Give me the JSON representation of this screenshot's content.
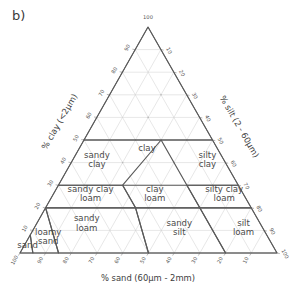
{
  "panel": {
    "label": "b)"
  },
  "axes": {
    "bottom": {
      "title": "% sand (60µm - 2mm)",
      "ticks": [
        100,
        90,
        80,
        70,
        60,
        50,
        40,
        30,
        20,
        10
      ]
    },
    "left": {
      "title": "% clay (<2µm)",
      "ticks": [
        10,
        20,
        30,
        40,
        50,
        60,
        70,
        80,
        90
      ]
    },
    "right": {
      "title": "% silt (2 - 60µm)",
      "ticks": [
        10,
        20,
        30,
        40,
        50,
        60,
        70,
        80,
        90,
        100
      ]
    },
    "apex": {
      "label": "100"
    }
  },
  "colors": {
    "grid": "#cfcfcf",
    "outline": "#6e6e6e",
    "class_boundary": "#5a5a5a",
    "text": "#4a4a4a",
    "background": "#ffffff"
  },
  "chart_data": {
    "type": "ternary-diagram",
    "title": "",
    "subtitle": "",
    "axis_a": {
      "name": "clay",
      "label": "% clay (<2µm)",
      "range": [
        0,
        100
      ],
      "position": "left"
    },
    "axis_b": {
      "name": "sand",
      "label": "% sand (60µm - 2mm)",
      "range": [
        0,
        100
      ],
      "position": "bottom"
    },
    "axis_c": {
      "name": "silt",
      "label": "% silt (2 - 60µm)",
      "range": [
        0,
        100
      ],
      "position": "right"
    },
    "grid": true,
    "grid_step": 10,
    "legend": "none",
    "classes": [
      {
        "name": "clay",
        "label": "clay",
        "label_pos": {
          "sand": 28,
          "silt": 27,
          "clay": 45
        },
        "vertices": [
          {
            "sand": 0,
            "clay": 100,
            "silt": 0
          },
          {
            "sand": 0,
            "clay": 50,
            "silt": 50
          },
          {
            "sand": 20,
            "clay": 50,
            "silt": 30
          },
          {
            "sand": 50,
            "clay": 50,
            "silt": 0
          }
        ]
      },
      {
        "name": "sandy-clay",
        "label": "sandy clay",
        "label_pos": {
          "sand": 50,
          "silt": 10,
          "clay": 40
        },
        "vertices": [
          {
            "sand": 50,
            "clay": 50,
            "silt": 0
          },
          {
            "sand": 70,
            "clay": 30,
            "silt": 0
          },
          {
            "sand": 45,
            "clay": 30,
            "silt": 25
          },
          {
            "sand": 20,
            "clay": 50,
            "silt": 30
          }
        ]
      },
      {
        "name": "silty-clay",
        "label": "silty clay",
        "label_pos": {
          "sand": 7,
          "silt": 53,
          "clay": 40
        },
        "vertices": [
          {
            "sand": 0,
            "clay": 50,
            "silt": 50
          },
          {
            "sand": 20,
            "clay": 50,
            "silt": 30
          },
          {
            "sand": 20,
            "clay": 30,
            "silt": 50
          },
          {
            "sand": 0,
            "clay": 30,
            "silt": 70
          }
        ]
      },
      {
        "name": "sandy-clay-loam",
        "label": "sandy clay loam",
        "label_pos": {
          "sand": 60,
          "silt": 15,
          "clay": 25
        },
        "vertices": [
          {
            "sand": 70,
            "clay": 30,
            "silt": 0
          },
          {
            "sand": 80,
            "clay": 20,
            "silt": 0
          },
          {
            "sand": 45,
            "clay": 20,
            "silt": 35
          },
          {
            "sand": 45,
            "clay": 30,
            "silt": 25
          }
        ]
      },
      {
        "name": "clay-loam",
        "label": "clay loam",
        "label_pos": {
          "sand": 35,
          "silt": 40,
          "clay": 25
        },
        "vertices": [
          {
            "sand": 45,
            "clay": 30,
            "silt": 25
          },
          {
            "sand": 45,
            "clay": 20,
            "silt": 35
          },
          {
            "sand": 20,
            "clay": 20,
            "silt": 60
          },
          {
            "sand": 20,
            "clay": 30,
            "silt": 50
          }
        ]
      },
      {
        "name": "silty-clay-loam",
        "label": "silty clay loam",
        "label_pos": {
          "sand": 8,
          "silt": 67,
          "clay": 25
        },
        "vertices": [
          {
            "sand": 20,
            "clay": 30,
            "silt": 50
          },
          {
            "sand": 20,
            "clay": 20,
            "silt": 60
          },
          {
            "sand": 0,
            "clay": 20,
            "silt": 80
          },
          {
            "sand": 0,
            "clay": 30,
            "silt": 70
          }
        ]
      },
      {
        "name": "sandy-loam",
        "label": "sandy loam",
        "label_pos": {
          "sand": 68,
          "silt": 20,
          "clay": 12
        },
        "vertices": [
          {
            "sand": 80,
            "clay": 20,
            "silt": 0
          },
          {
            "sand": 85,
            "clay": 0,
            "silt": 15
          },
          {
            "sand": 50,
            "clay": 0,
            "silt": 50
          },
          {
            "sand": 45,
            "clay": 20,
            "silt": 35
          }
        ]
      },
      {
        "name": "sandy-silt",
        "label": "sandy silt",
        "label_pos": {
          "sand": 33,
          "silt": 57,
          "clay": 10
        },
        "vertices": [
          {
            "sand": 45,
            "clay": 20,
            "silt": 35
          },
          {
            "sand": 50,
            "clay": 0,
            "silt": 50
          },
          {
            "sand": 20,
            "clay": 0,
            "silt": 80
          },
          {
            "sand": 20,
            "clay": 20,
            "silt": 60
          }
        ]
      },
      {
        "name": "silt-loam",
        "label": "silt loam",
        "label_pos": {
          "sand": 8,
          "silt": 82,
          "clay": 10
        },
        "vertices": [
          {
            "sand": 20,
            "clay": 20,
            "silt": 60
          },
          {
            "sand": 20,
            "clay": 0,
            "silt": 80
          },
          {
            "sand": 0,
            "clay": 0,
            "silt": 100
          },
          {
            "sand": 0,
            "clay": 20,
            "silt": 80
          }
        ]
      },
      {
        "name": "loamy-sand",
        "label": "loamy sand",
        "label_pos": {
          "sand": 86,
          "silt": 8,
          "clay": 6
        },
        "vertices": [
          {
            "sand": 92,
            "clay": 8,
            "silt": 0
          },
          {
            "sand": 95,
            "clay": 0,
            "silt": 5
          },
          {
            "sand": 85,
            "clay": 0,
            "silt": 15
          },
          {
            "sand": 80,
            "clay": 20,
            "silt": 0
          }
        ]
      },
      {
        "name": "sand",
        "label": "sand",
        "label_pos": {
          "sand": 96,
          "silt": 2,
          "clay": 2
        },
        "vertices": [
          {
            "sand": 100,
            "clay": 0,
            "silt": 0
          },
          {
            "sand": 92,
            "clay": 8,
            "silt": 0
          },
          {
            "sand": 95,
            "clay": 0,
            "silt": 5
          }
        ]
      }
    ]
  }
}
